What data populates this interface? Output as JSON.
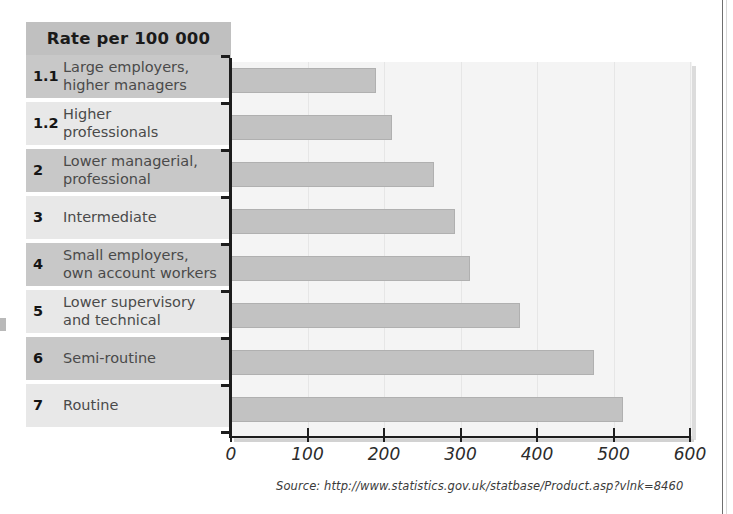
{
  "chart_data": {
    "type": "bar",
    "orientation": "horizontal",
    "title": "Rate per 100 000",
    "xlabel": "",
    "ylabel": "",
    "xlim": [
      0,
      600
    ],
    "grid": true,
    "legend": null,
    "x_ticks": [
      "0",
      "100",
      "200",
      "300",
      "400",
      "500",
      "600"
    ],
    "x_tick_values": [
      0,
      100,
      200,
      300,
      400,
      500,
      600
    ],
    "categories": [
      "Large employers,\nhigher managers",
      "Higher\nprofessionals",
      "Lower managerial,\nprofessional",
      "Intermediate",
      "Small employers,\nown account workers",
      "Lower supervisory\nand technical",
      "Semi-routine",
      "Routine"
    ],
    "category_codes": [
      "1.1",
      "1.2",
      "2",
      "3",
      "4",
      "5",
      "6",
      "7"
    ],
    "values": [
      190,
      210,
      266,
      293,
      312,
      378,
      475,
      512
    ],
    "source": "Source: http://www.statistics.gov.uk/statbase/Product.asp?vlnk=8460"
  },
  "table": {
    "header": "Rate per 100 000",
    "rows": [
      {
        "code": "1.1",
        "label": "Large employers,\nhigher managers",
        "value": 190
      },
      {
        "code": "1.2",
        "label": "Higher\nprofessionals",
        "value": 210
      },
      {
        "code": "2",
        "label": "Lower managerial,\nprofessional",
        "value": 266
      },
      {
        "code": "3",
        "label": "Intermediate",
        "value": 293
      },
      {
        "code": "4",
        "label": "Small employers,\nown account workers",
        "value": 312
      },
      {
        "code": "5",
        "label": "Lower supervisory\nand technical",
        "value": 378
      },
      {
        "code": "6",
        "label": "Semi-routine",
        "value": 475
      },
      {
        "code": "7",
        "label": "Routine",
        "value": 512
      }
    ]
  },
  "colors": {
    "bar_fill": "#c2c2c2",
    "bar_stroke": "#b0b0b0",
    "header_band": "#c0c0c0",
    "row_dark": "#c8c8c8",
    "row_light": "#e8e8e8",
    "plot_bg": "#f4f4f4",
    "axis": "#1d1d1d"
  }
}
